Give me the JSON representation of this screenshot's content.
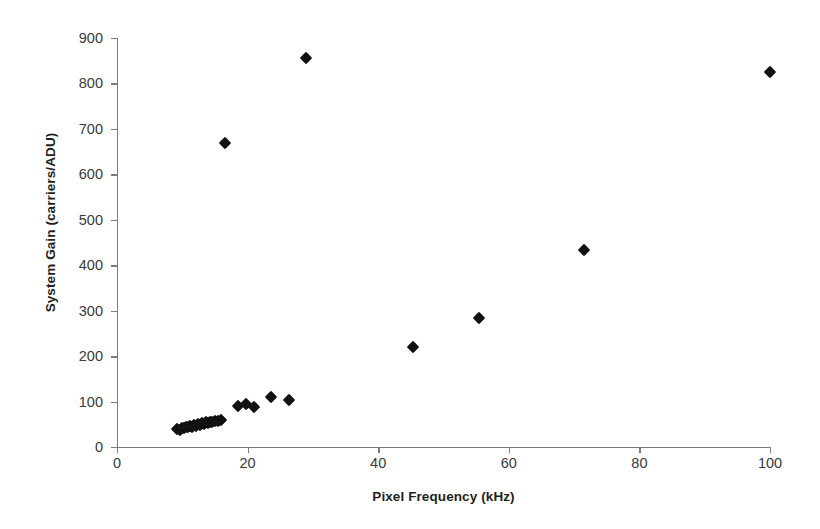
{
  "chart_data": {
    "type": "scatter",
    "title": "",
    "xlabel": "Pixel Frequency (kHz)",
    "ylabel": "System Gain (carriers/ADU)",
    "xlim": [
      0,
      100
    ],
    "ylim": [
      0,
      900
    ],
    "xticks": [
      0,
      20,
      40,
      60,
      80,
      100
    ],
    "yticks": [
      0,
      100,
      200,
      300,
      400,
      500,
      600,
      700,
      800,
      900
    ],
    "xtick_labels": [
      "0",
      "20",
      "40",
      "60",
      "80",
      "100"
    ],
    "ytick_labels": [
      "0",
      "100",
      "200",
      "300",
      "400",
      "500",
      "600",
      "700",
      "800",
      "900"
    ],
    "grid": false,
    "legend": false,
    "marker": "diamond",
    "marker_color": "#111111",
    "series": [
      {
        "name": "System gain vs pixel frequency",
        "points": [
          [
            9.2,
            40
          ],
          [
            9.6,
            38
          ],
          [
            10.0,
            42
          ],
          [
            10.3,
            41
          ],
          [
            10.6,
            44
          ],
          [
            10.9,
            43
          ],
          [
            11.2,
            46
          ],
          [
            11.5,
            45
          ],
          [
            11.8,
            48
          ],
          [
            12.1,
            47
          ],
          [
            12.4,
            50
          ],
          [
            12.7,
            49
          ],
          [
            13.0,
            52
          ],
          [
            13.3,
            51
          ],
          [
            13.6,
            54
          ],
          [
            13.9,
            53
          ],
          [
            14.2,
            56
          ],
          [
            14.6,
            55
          ],
          [
            15.0,
            58
          ],
          [
            15.4,
            57
          ],
          [
            15.9,
            60
          ],
          [
            16.5,
            668
          ],
          [
            18.5,
            90
          ],
          [
            19.8,
            95
          ],
          [
            21.0,
            88
          ],
          [
            23.6,
            110
          ],
          [
            26.3,
            104
          ],
          [
            29.0,
            855
          ],
          [
            45.3,
            220
          ],
          [
            55.5,
            284
          ],
          [
            71.5,
            434
          ],
          [
            100.0,
            825
          ]
        ]
      }
    ]
  },
  "axes": {
    "x_origin_px": 117,
    "y_origin_px": 447,
    "px_per_x_unit": 6.53,
    "px_per_y_unit": 0.4544
  }
}
